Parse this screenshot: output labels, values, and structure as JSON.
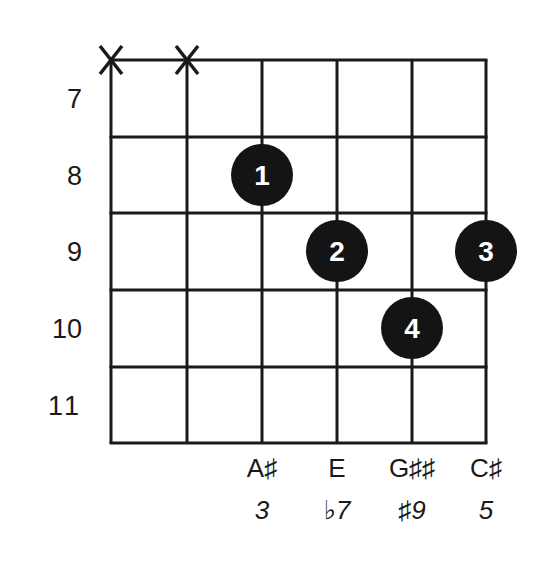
{
  "chord_diagram": {
    "grid": {
      "strings_x": [
        111,
        187,
        262,
        337,
        412,
        486
      ],
      "frets_y": [
        60,
        137,
        213,
        290,
        367,
        443
      ],
      "line_color": "#1a1a1a"
    },
    "muted_strings": [
      {
        "string": 1,
        "symbol": "X"
      },
      {
        "string": 2,
        "symbol": "X"
      }
    ],
    "fret_numbers": [
      {
        "label": "7",
        "y": 99
      },
      {
        "label": "8",
        "y": 176
      },
      {
        "label": "9",
        "y": 252
      },
      {
        "label": "10",
        "y": 329
      },
      {
        "label": "11",
        "y": 406
      }
    ],
    "fingers": [
      {
        "finger": "1",
        "string": 3,
        "fret": 8,
        "cx": 262,
        "cy": 175
      },
      {
        "finger": "2",
        "string": 4,
        "fret": 9,
        "cx": 337,
        "cy": 251
      },
      {
        "finger": "3",
        "string": 6,
        "fret": 9,
        "cx": 486,
        "cy": 251
      },
      {
        "finger": "4",
        "string": 5,
        "fret": 10,
        "cx": 412,
        "cy": 328
      }
    ],
    "notes": [
      {
        "label": "A♯",
        "x": 262
      },
      {
        "label": "E",
        "x": 337
      },
      {
        "label": "G♯♯",
        "x": 412
      },
      {
        "label": "C♯",
        "x": 486
      }
    ],
    "intervals": [
      {
        "label": "3",
        "x": 262
      },
      {
        "label": "♭7",
        "x": 337
      },
      {
        "label": "♯9",
        "x": 412
      },
      {
        "label": "5",
        "x": 486
      }
    ],
    "dot_color": "#141414",
    "dot_text_color": "#ffffff"
  }
}
